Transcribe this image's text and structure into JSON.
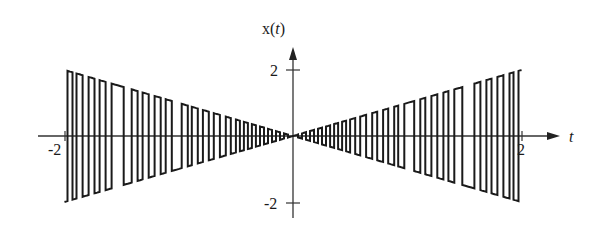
{
  "chart_data": {
    "type": "line",
    "title": "",
    "xlabel": "t",
    "ylabel": "x(t)",
    "xlim": [
      -2,
      2
    ],
    "ylim": [
      -2,
      2
    ],
    "x_ticks": [
      {
        "value": -2,
        "label": "-2"
      },
      {
        "value": 2,
        "label": "2"
      }
    ],
    "y_ticks": [
      {
        "value": 2,
        "label": "2"
      },
      {
        "value": -2,
        "label": "-2"
      }
    ],
    "grid": false,
    "legend": null,
    "envelope": "abs(t)",
    "start_level": "low",
    "transition_times": [
      -1.974,
      -1.93,
      -1.895,
      -1.842,
      -1.789,
      -1.737,
      -1.693,
      -1.64,
      -1.588,
      -1.482,
      -1.412,
      -1.36,
      -1.316,
      -1.263,
      -1.211,
      -1.158,
      -1.114,
      -1.061,
      -0.974,
      -0.921,
      -0.886,
      -0.833,
      -0.789,
      -0.737,
      -0.693,
      -0.64,
      -0.588,
      -0.544,
      -0.5,
      -0.465,
      -0.43,
      -0.395,
      -0.36,
      -0.325,
      -0.289,
      -0.254,
      -0.219,
      -0.184,
      -0.149,
      -0.114,
      -0.079,
      -0.044,
      0.0,
      0.044,
      0.079,
      0.114,
      0.149,
      0.184,
      0.219,
      0.254,
      0.289,
      0.325,
      0.36,
      0.395,
      0.43,
      0.465,
      0.5,
      0.544,
      0.588,
      0.64,
      0.693,
      0.737,
      0.789,
      0.833,
      0.886,
      0.921,
      0.974,
      1.061,
      1.114,
      1.158,
      1.211,
      1.263,
      1.316,
      1.36,
      1.412,
      1.482,
      1.588,
      1.64,
      1.693,
      1.737,
      1.789,
      1.842,
      1.895,
      1.93,
      1.974
    ]
  },
  "labels": {
    "y_axis": "x(t)",
    "x_axis": "t",
    "y_tick_top": "2",
    "y_tick_bottom": "-2",
    "x_tick_left": "-2",
    "x_tick_right": "2"
  },
  "colors": {
    "line": "#1a1a1a",
    "axis": "#333333",
    "background": "#ffffff"
  }
}
